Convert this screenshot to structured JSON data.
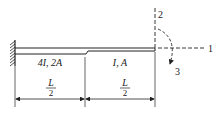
{
  "diagram": {
    "segments": [
      {
        "label": "4I, 2A",
        "length_num": "L",
        "length_den": "2"
      },
      {
        "label": "I, A",
        "length_num": "L",
        "length_den": "2"
      }
    ],
    "axes": {
      "axis1": "1",
      "axis2": "2",
      "axis3": "3"
    },
    "colors": {
      "line": "#222222",
      "background": "#ffffff"
    }
  }
}
